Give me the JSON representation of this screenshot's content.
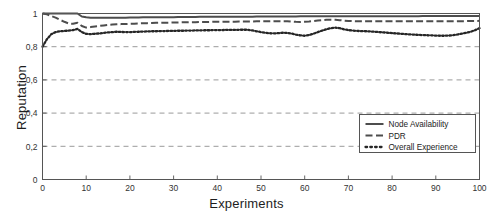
{
  "chart_data": {
    "type": "line",
    "title": "",
    "xlabel": "Experiments",
    "ylabel": "Reputation",
    "xlim": [
      0,
      100
    ],
    "ylim": [
      0,
      1
    ],
    "grid": true,
    "grid_axis": "y",
    "grid_style": "dashed",
    "legend_position": "lower right",
    "xticks": [
      0,
      10,
      20,
      30,
      40,
      50,
      60,
      70,
      80,
      90,
      100
    ],
    "xticklabels": [
      "0",
      "10",
      "20",
      "30",
      "40",
      "50",
      "60",
      "70",
      "80",
      "90",
      "100"
    ],
    "yticks": [
      0,
      0.2,
      0.4,
      0.6,
      0.8,
      1
    ],
    "yticklabels": [
      "0",
      "0,2",
      "0,4",
      "0,6",
      "0,8",
      "1"
    ],
    "series": [
      {
        "name": "Node Availability",
        "style": "solid",
        "color": "#4d4d4d",
        "x": [
          0,
          1,
          2,
          3,
          4,
          5,
          6,
          7,
          8,
          9,
          10,
          11,
          12,
          13,
          14,
          15,
          16,
          17,
          18,
          19,
          20,
          21,
          22,
          23,
          24,
          25,
          26,
          27,
          28,
          29,
          30,
          31,
          32,
          33,
          34,
          35,
          36,
          37,
          38,
          39,
          40,
          41,
          42,
          43,
          44,
          45,
          46,
          47,
          48,
          49,
          50,
          51,
          52,
          53,
          54,
          55,
          56,
          57,
          58,
          59,
          60,
          61,
          62,
          63,
          64,
          65,
          66,
          67,
          68,
          69,
          70,
          71,
          72,
          73,
          74,
          75,
          76,
          77,
          78,
          79,
          80,
          81,
          82,
          83,
          84,
          85,
          86,
          87,
          88,
          89,
          90,
          91,
          92,
          93,
          94,
          95,
          96,
          97,
          98,
          99,
          100
        ],
        "y": [
          1.0,
          1.0,
          1.0,
          1.0,
          1.0,
          1.0,
          1.0,
          1.0,
          1.0,
          0.982,
          0.977,
          0.975,
          0.974,
          0.974,
          0.974,
          0.974,
          0.974,
          0.975,
          0.975,
          0.975,
          0.976,
          0.976,
          0.976,
          0.977,
          0.977,
          0.977,
          0.977,
          0.978,
          0.978,
          0.978,
          0.978,
          0.979,
          0.979,
          0.979,
          0.979,
          0.979,
          0.98,
          0.98,
          0.98,
          0.98,
          0.98,
          0.98,
          0.981,
          0.981,
          0.981,
          0.981,
          0.981,
          0.981,
          0.981,
          0.982,
          0.982,
          0.982,
          0.982,
          0.982,
          0.982,
          0.982,
          0.982,
          0.982,
          0.982,
          0.983,
          0.983,
          0.983,
          0.983,
          0.983,
          0.983,
          0.983,
          0.983,
          0.983,
          0.983,
          0.983,
          0.983,
          0.984,
          0.984,
          0.984,
          0.984,
          0.984,
          0.984,
          0.984,
          0.984,
          0.984,
          0.984,
          0.984,
          0.984,
          0.984,
          0.984,
          0.984,
          0.984,
          0.985,
          0.985,
          0.985,
          0.985,
          0.985,
          0.985,
          0.985,
          0.985,
          0.985,
          0.985,
          0.985,
          0.985,
          0.985,
          0.985
        ]
      },
      {
        "name": "PDR",
        "style": "dashed",
        "color": "#4d4d4d",
        "x": [
          0,
          1,
          2,
          3,
          4,
          5,
          6,
          7,
          8,
          9,
          10,
          11,
          12,
          13,
          14,
          15,
          16,
          17,
          18,
          19,
          20,
          21,
          22,
          23,
          24,
          25,
          26,
          27,
          28,
          29,
          30,
          31,
          32,
          33,
          34,
          35,
          36,
          37,
          38,
          39,
          40,
          41,
          42,
          43,
          44,
          45,
          46,
          47,
          48,
          49,
          50,
          51,
          52,
          53,
          54,
          55,
          56,
          57,
          58,
          59,
          60,
          61,
          62,
          63,
          64,
          65,
          66,
          67,
          68,
          69,
          70,
          71,
          72,
          73,
          74,
          75,
          76,
          77,
          78,
          79,
          80,
          81,
          82,
          83,
          84,
          85,
          86,
          87,
          88,
          89,
          90,
          91,
          92,
          93,
          94,
          95,
          96,
          97,
          98,
          99,
          100
        ],
        "y": [
          1.0,
          0.995,
          0.985,
          0.975,
          0.962,
          0.95,
          0.94,
          0.938,
          0.944,
          0.925,
          0.915,
          0.918,
          0.922,
          0.925,
          0.928,
          0.931,
          0.933,
          0.935,
          0.936,
          0.937,
          0.938,
          0.939,
          0.94,
          0.941,
          0.942,
          0.943,
          0.944,
          0.944,
          0.945,
          0.945,
          0.946,
          0.946,
          0.947,
          0.947,
          0.948,
          0.948,
          0.949,
          0.949,
          0.949,
          0.95,
          0.95,
          0.95,
          0.951,
          0.951,
          0.951,
          0.952,
          0.952,
          0.952,
          0.952,
          0.953,
          0.953,
          0.953,
          0.953,
          0.954,
          0.954,
          0.954,
          0.954,
          0.952,
          0.95,
          0.949,
          0.95,
          0.952,
          0.955,
          0.958,
          0.96,
          0.962,
          0.963,
          0.962,
          0.96,
          0.957,
          0.955,
          0.954,
          0.953,
          0.953,
          0.953,
          0.953,
          0.953,
          0.953,
          0.953,
          0.953,
          0.953,
          0.953,
          0.953,
          0.953,
          0.953,
          0.953,
          0.953,
          0.953,
          0.953,
          0.953,
          0.953,
          0.953,
          0.953,
          0.953,
          0.954,
          0.954,
          0.954,
          0.954,
          0.955,
          0.955,
          0.956
        ]
      },
      {
        "name": "Overall Experience",
        "style": "dotted",
        "color": "#262626",
        "x": [
          0,
          1,
          2,
          3,
          4,
          5,
          6,
          7,
          8,
          9,
          10,
          11,
          12,
          13,
          14,
          15,
          16,
          17,
          18,
          19,
          20,
          21,
          22,
          23,
          24,
          25,
          26,
          27,
          28,
          29,
          30,
          31,
          32,
          33,
          34,
          35,
          36,
          37,
          38,
          39,
          40,
          41,
          42,
          43,
          44,
          45,
          46,
          47,
          48,
          49,
          50,
          51,
          52,
          53,
          54,
          55,
          56,
          57,
          58,
          59,
          60,
          61,
          62,
          63,
          64,
          65,
          66,
          67,
          68,
          69,
          70,
          71,
          72,
          73,
          74,
          75,
          76,
          77,
          78,
          79,
          80,
          81,
          82,
          83,
          84,
          85,
          86,
          87,
          88,
          89,
          90,
          91,
          92,
          93,
          94,
          95,
          96,
          97,
          98,
          99,
          100
        ],
        "y": [
          0.8,
          0.845,
          0.875,
          0.888,
          0.893,
          0.895,
          0.897,
          0.9,
          0.907,
          0.888,
          0.877,
          0.876,
          0.878,
          0.88,
          0.883,
          0.886,
          0.888,
          0.89,
          0.889,
          0.888,
          0.888,
          0.889,
          0.89,
          0.891,
          0.892,
          0.893,
          0.893,
          0.894,
          0.894,
          0.895,
          0.895,
          0.896,
          0.896,
          0.897,
          0.897,
          0.898,
          0.898,
          0.899,
          0.899,
          0.9,
          0.9,
          0.9,
          0.901,
          0.901,
          0.901,
          0.902,
          0.902,
          0.902,
          0.898,
          0.893,
          0.888,
          0.884,
          0.881,
          0.88,
          0.882,
          0.884,
          0.883,
          0.879,
          0.873,
          0.868,
          0.866,
          0.87,
          0.878,
          0.888,
          0.897,
          0.905,
          0.912,
          0.915,
          0.912,
          0.905,
          0.9,
          0.897,
          0.895,
          0.894,
          0.893,
          0.892,
          0.89,
          0.888,
          0.886,
          0.884,
          0.882,
          0.88,
          0.878,
          0.876,
          0.874,
          0.873,
          0.871,
          0.87,
          0.869,
          0.868,
          0.867,
          0.866,
          0.866,
          0.867,
          0.87,
          0.874,
          0.879,
          0.884,
          0.89,
          0.9,
          0.912
        ]
      }
    ]
  },
  "legend": {
    "items": [
      {
        "label": "Node Availability",
        "marker": "solid-line"
      },
      {
        "label": "PDR",
        "marker": "dashed-line"
      },
      {
        "label": "Overall Experience",
        "marker": "dotted-line"
      }
    ]
  }
}
